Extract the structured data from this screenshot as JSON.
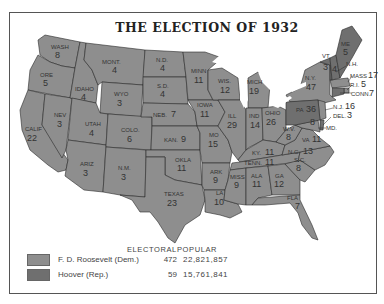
{
  "title": "THE ELECTION OF 1932",
  "colors": {
    "democrat": "#8e8e8e",
    "republican": "#6f6f6f",
    "border": "#2a2a2a",
    "frame": "#555555"
  },
  "legend": {
    "electoral_header": "ELECTORAL",
    "popular_header": "POPULAR",
    "entries": [
      {
        "candidate": "F. D. Roosevelt (Dem.)",
        "electoral": "472",
        "popular": "22,821,857",
        "swatch": "#8e8e8e"
      },
      {
        "candidate": "Hoover (Rep.)",
        "electoral": "59",
        "popular": "15,761,841",
        "swatch": "#6f6f6f"
      }
    ]
  },
  "states": [
    {
      "abbr": "WASH",
      "ev": "8",
      "winner": "Dem"
    },
    {
      "abbr": "ORE",
      "ev": "5",
      "winner": "Dem"
    },
    {
      "abbr": "CALIF",
      "ev": "22",
      "winner": "Dem"
    },
    {
      "abbr": "IDAHO",
      "ev": "4",
      "winner": "Dem"
    },
    {
      "abbr": "NEV",
      "ev": "3",
      "winner": "Dem"
    },
    {
      "abbr": "MONT",
      "ev": "4",
      "winner": "Dem"
    },
    {
      "abbr": "WYO",
      "ev": "3",
      "winner": "Dem"
    },
    {
      "abbr": "UTAH",
      "ev": "4",
      "winner": "Dem"
    },
    {
      "abbr": "ARIZ",
      "ev": "3",
      "winner": "Dem"
    },
    {
      "abbr": "COLO",
      "ev": "6",
      "winner": "Dem"
    },
    {
      "abbr": "N.M.",
      "ev": "3",
      "winner": "Dem"
    },
    {
      "abbr": "N.D.",
      "ev": "4",
      "winner": "Dem"
    },
    {
      "abbr": "S.D.",
      "ev": "4",
      "winner": "Dem"
    },
    {
      "abbr": "NEB",
      "ev": "7",
      "winner": "Dem"
    },
    {
      "abbr": "KAN",
      "ev": "9",
      "winner": "Dem"
    },
    {
      "abbr": "OKLA",
      "ev": "11",
      "winner": "Dem"
    },
    {
      "abbr": "TEXAS",
      "ev": "23",
      "winner": "Dem"
    },
    {
      "abbr": "MINN",
      "ev": "11",
      "winner": "Dem"
    },
    {
      "abbr": "IOWA",
      "ev": "11",
      "winner": "Dem"
    },
    {
      "abbr": "MO",
      "ev": "15",
      "winner": "Dem"
    },
    {
      "abbr": "ARK",
      "ev": "9",
      "winner": "Dem"
    },
    {
      "abbr": "LA",
      "ev": "10",
      "winner": "Dem"
    },
    {
      "abbr": "WIS",
      "ev": "12",
      "winner": "Dem"
    },
    {
      "abbr": "ILL",
      "ev": "29",
      "winner": "Dem"
    },
    {
      "abbr": "MICH",
      "ev": "19",
      "winner": "Dem"
    },
    {
      "abbr": "IND",
      "ev": "14",
      "winner": "Dem"
    },
    {
      "abbr": "OHIO",
      "ev": "26",
      "winner": "Dem"
    },
    {
      "abbr": "KY",
      "ev": "11",
      "winner": "Dem"
    },
    {
      "abbr": "TENN",
      "ev": "11",
      "winner": "Dem"
    },
    {
      "abbr": "MISS",
      "ev": "9",
      "winner": "Dem"
    },
    {
      "abbr": "ALA",
      "ev": "11",
      "winner": "Dem"
    },
    {
      "abbr": "GA",
      "ev": "12",
      "winner": "Dem"
    },
    {
      "abbr": "FLA",
      "ev": "7",
      "winner": "Dem"
    },
    {
      "abbr": "S.C.",
      "ev": "8",
      "winner": "Dem"
    },
    {
      "abbr": "N.C.",
      "ev": "13",
      "winner": "Dem"
    },
    {
      "abbr": "VA",
      "ev": "11",
      "winner": "Dem"
    },
    {
      "abbr": "W.V.",
      "ev": "8",
      "winner": "Dem"
    },
    {
      "abbr": "MD",
      "ev": "8",
      "winner": "Dem"
    },
    {
      "abbr": "DEL",
      "ev": "3",
      "winner": "Rep"
    },
    {
      "abbr": "N.J.",
      "ev": "16",
      "winner": "Dem"
    },
    {
      "abbr": "PA",
      "ev": "36",
      "winner": "Rep"
    },
    {
      "abbr": "N.Y.",
      "ev": "47",
      "winner": "Dem"
    },
    {
      "abbr": "CONN",
      "ev": "7",
      "winner": "Rep"
    },
    {
      "abbr": "R.I.",
      "ev": "5",
      "winner": "Dem"
    },
    {
      "abbr": "MASS",
      "ev": "17",
      "winner": "Dem"
    },
    {
      "abbr": "VT",
      "ev": "3",
      "winner": "Rep"
    },
    {
      "abbr": "N.H.",
      "ev": "4",
      "winner": "Rep"
    },
    {
      "abbr": "ME",
      "ev": "5",
      "winner": "Rep"
    }
  ]
}
